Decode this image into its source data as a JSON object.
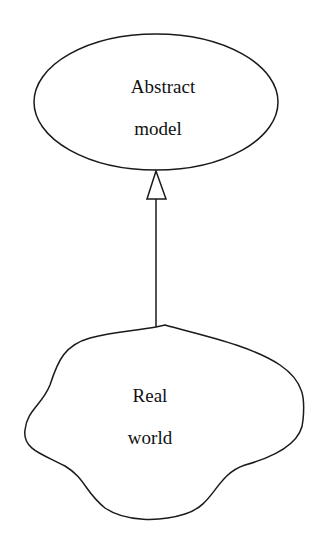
{
  "diagram": {
    "type": "modeling-relationship",
    "nodes": [
      {
        "id": "abstract-model",
        "shape": "ellipse",
        "lines": [
          "Abstract",
          "model"
        ]
      },
      {
        "id": "real-world",
        "shape": "cloud",
        "lines": [
          "Real",
          "world"
        ]
      }
    ],
    "edges": [
      {
        "from": "real-world",
        "to": "abstract-model",
        "arrowhead": "hollow-triangle"
      }
    ],
    "colors": {
      "stroke": "#1a1a1a",
      "text": "#111111",
      "background": "#ffffff"
    }
  }
}
